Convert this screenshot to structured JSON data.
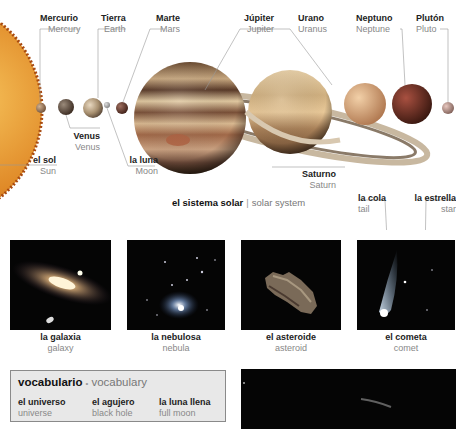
{
  "solar_system": {
    "caption": {
      "es": "el sistema solar",
      "en": "solar system",
      "separator": "|"
    },
    "labels": [
      {
        "id": "sun",
        "es": "el sol",
        "en": "Sun"
      },
      {
        "id": "mercury",
        "es": "Mercurio",
        "en": "Mercury"
      },
      {
        "id": "venus",
        "es": "Venus",
        "en": "Venus"
      },
      {
        "id": "earth",
        "es": "Tierra",
        "en": "Earth"
      },
      {
        "id": "moon",
        "es": "la luna",
        "en": "Moon"
      },
      {
        "id": "mars",
        "es": "Marte",
        "en": "Mars"
      },
      {
        "id": "jupiter",
        "es": "Júpiter",
        "en": "Jupiter"
      },
      {
        "id": "saturn",
        "es": "Saturno",
        "en": "Saturn"
      },
      {
        "id": "uranus",
        "es": "Urano",
        "en": "Uranus"
      },
      {
        "id": "neptune",
        "es": "Neptuno",
        "en": "Neptune"
      },
      {
        "id": "pluto",
        "es": "Plutón",
        "en": "Pluto"
      }
    ],
    "colors": {
      "sun": "#e8a23a",
      "mercury": "#a08060",
      "venus": "#8a6a50",
      "earth": "#7a9ab8",
      "moon": "#b0b0b0",
      "mars": "#8a4a30",
      "jupiter": "#b08860",
      "saturn": "#c8a878",
      "uranus": "#d8a878",
      "neptune": "#8a3828",
      "pluto": "#b89888"
    }
  },
  "comet_labels": {
    "tail": {
      "es": "la cola",
      "en": "tail"
    },
    "star": {
      "es": "la estrella",
      "en": "star"
    }
  },
  "photos": [
    {
      "id": "galaxy",
      "es": "la galaxia",
      "en": "galaxy"
    },
    {
      "id": "nebula",
      "es": "la nebulosa",
      "en": "nebula"
    },
    {
      "id": "asteroid",
      "es": "el asteroide",
      "en": "asteroid"
    },
    {
      "id": "comet",
      "es": "el cometa",
      "en": "comet"
    }
  ],
  "vocabulary": {
    "title_es": "vocabulario",
    "bullet": "•",
    "title_en": "vocabulary",
    "words": [
      {
        "es": "el universo",
        "en": "universe"
      },
      {
        "es": "el agujero",
        "en": "black hole"
      },
      {
        "es": "la luna llena",
        "en": "full moon"
      }
    ]
  }
}
